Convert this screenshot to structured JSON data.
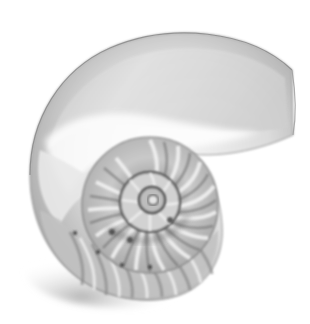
{
  "image": {
    "subject": "nautilus shell cross-section",
    "style": "grayscale photograph",
    "background_color": "#ffffff",
    "tones": {
      "shell_light": "#f4f4f4",
      "shell_mid": "#b8b8b8",
      "shell_dark": "#5a5a5a",
      "shadow": "#8c8c8c"
    }
  }
}
